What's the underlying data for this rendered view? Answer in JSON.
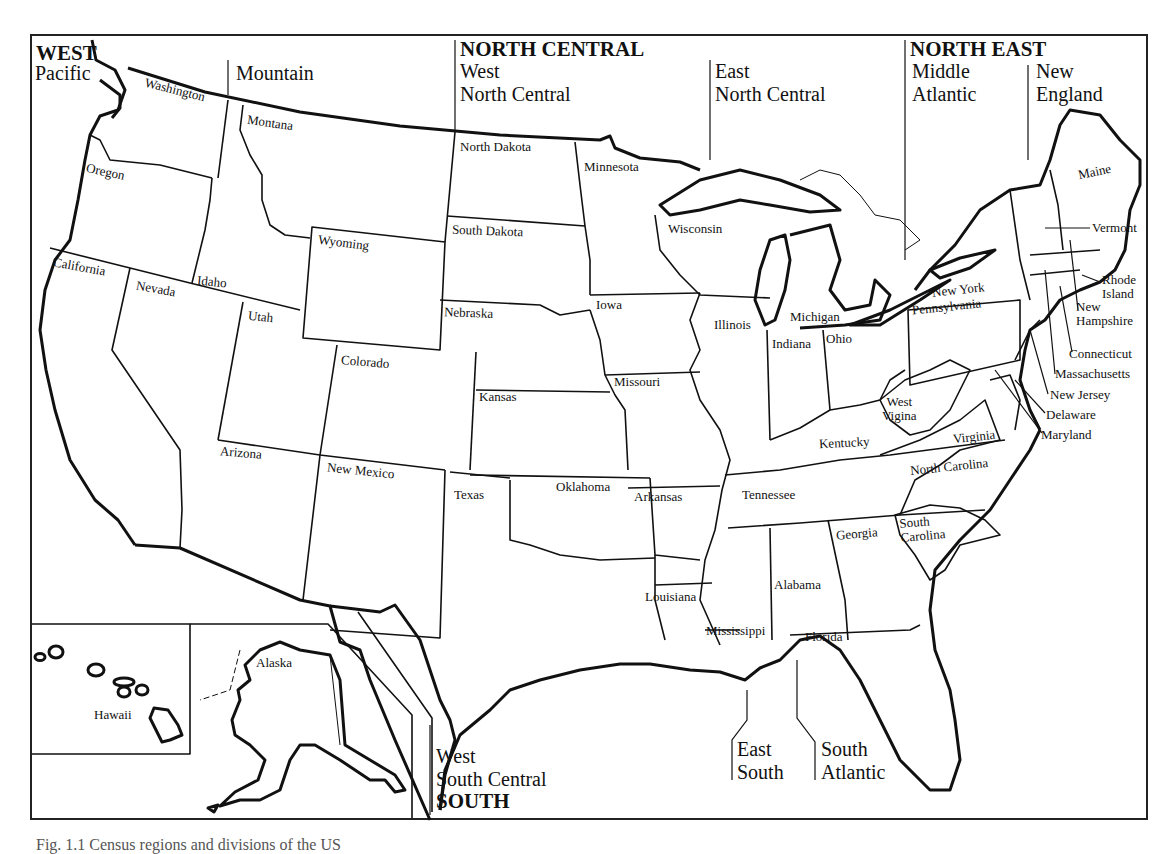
{
  "regions": {
    "west": "WEST",
    "north_central": "NORTH CENTRAL",
    "north_east": "NORTH EAST",
    "south": "SOUTH"
  },
  "divisions": {
    "pacific": "Pacific",
    "mountain": "Mountain",
    "west_north_central": "West\nNorth Central",
    "east_north_central": "East\nNorth Central",
    "middle_atlantic": "Middle\nAtlantic",
    "new_england": "New\nEngland",
    "west_south_central": "West\nSouth Central",
    "east_south": "East\nSouth",
    "south_atlantic": "South\nAtlantic"
  },
  "states": {
    "washington": "Washington",
    "oregon": "Oregon",
    "california": "California",
    "montana": "Montana",
    "idaho": "Idaho",
    "nevada": "Nevada",
    "wyoming": "Wyoming",
    "utah": "Utah",
    "colorado": "Colorado",
    "arizona": "Arizona",
    "new_mexico": "New Mexico",
    "north_dakota": "North Dakota",
    "south_dakota": "South Dakota",
    "nebraska": "Nebraska",
    "kansas": "Kansas",
    "minnesota": "Minnesota",
    "iowa": "Iowa",
    "missouri": "Missouri",
    "wisconsin": "Wisconsin",
    "illinois": "Illinois",
    "michigan": "Michigan",
    "indiana": "Indiana",
    "ohio": "Ohio",
    "texas": "Texas",
    "oklahoma": "Oklahoma",
    "arkansas": "Arkansas",
    "louisiana": "Louisiana",
    "kentucky": "Kentucky",
    "tennessee": "Tennessee",
    "mississippi": "Mississippi",
    "alabama": "Alabama",
    "west_virginia": "West\nVigina",
    "virginia": "Virginia",
    "north_carolina": "North Carolina",
    "south_carolina": "South\nCarolina",
    "georgia": "Georgia",
    "florida": "Florida",
    "new_york": "New York",
    "pennsylvania": "Pennsylvania",
    "new_jersey": "New Jersey",
    "delaware": "Delaware",
    "maryland": "Maryland",
    "maine": "Maine",
    "vermont": "Vermont",
    "new_hampshire": "New\nHampshire",
    "massachusetts": "Massachusetts",
    "rhode_island": "Rhode\nIsland",
    "connecticut": "Connecticut",
    "alaska": "Alaska",
    "hawaii": "Hawaii"
  },
  "caption": "Fig. 1.1 Census regions and divisions of the US"
}
